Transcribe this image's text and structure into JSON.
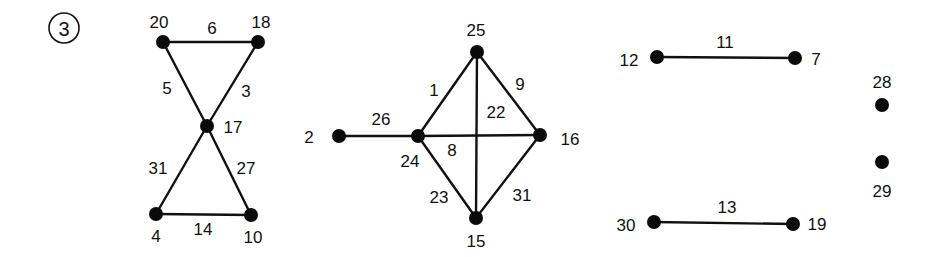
{
  "problem": {
    "number": "3",
    "x": 64,
    "y": 28,
    "r": 15
  },
  "colors": {
    "ink": "#111111",
    "background": "#ffffff"
  },
  "graph": {
    "nodes": [
      {
        "id": "20",
        "x": 163,
        "y": 42,
        "label": "20",
        "lx": 159,
        "ly": 22
      },
      {
        "id": "18",
        "x": 258,
        "y": 42,
        "label": "18",
        "lx": 261,
        "ly": 22
      },
      {
        "id": "17",
        "x": 207,
        "y": 126,
        "label": "17",
        "lx": 233,
        "ly": 127
      },
      {
        "id": "4",
        "x": 156,
        "y": 214,
        "label": "4",
        "lx": 156,
        "ly": 236
      },
      {
        "id": "10",
        "x": 251,
        "y": 215,
        "label": "10",
        "lx": 253,
        "ly": 237
      },
      {
        "id": "2",
        "x": 339,
        "y": 136,
        "label": "2",
        "lx": 309,
        "ly": 137
      },
      {
        "id": "24",
        "x": 418,
        "y": 136,
        "label": "24",
        "lx": 410,
        "ly": 161
      },
      {
        "id": "25",
        "x": 477,
        "y": 52,
        "label": "25",
        "lx": 476,
        "ly": 30
      },
      {
        "id": "16",
        "x": 540,
        "y": 135,
        "label": "16",
        "lx": 570,
        "ly": 139
      },
      {
        "id": "15",
        "x": 476,
        "y": 218,
        "label": "15",
        "lx": 476,
        "ly": 241
      },
      {
        "id": "12",
        "x": 657,
        "y": 57,
        "label": "12",
        "lx": 629,
        "ly": 60
      },
      {
        "id": "7",
        "x": 795,
        "y": 58,
        "label": "7",
        "lx": 816,
        "ly": 59
      },
      {
        "id": "28",
        "x": 882,
        "y": 105,
        "label": "28",
        "lx": 882,
        "ly": 82
      },
      {
        "id": "29",
        "x": 882,
        "y": 162,
        "label": "29",
        "lx": 882,
        "ly": 191
      },
      {
        "id": "30",
        "x": 654,
        "y": 222,
        "label": "30",
        "lx": 626,
        "ly": 225
      },
      {
        "id": "19",
        "x": 793,
        "y": 224,
        "label": "19",
        "lx": 817,
        "ly": 224
      }
    ],
    "edges": [
      {
        "from": "20",
        "to": "18",
        "weight": "6",
        "lx": 212,
        "ly": 28
      },
      {
        "from": "20",
        "to": "17",
        "weight": "5",
        "lx": 167,
        "ly": 88
      },
      {
        "from": "18",
        "to": "17",
        "weight": "3",
        "lx": 246,
        "ly": 91
      },
      {
        "from": "17",
        "to": "4",
        "weight": "31",
        "lx": 158,
        "ly": 168
      },
      {
        "from": "17",
        "to": "10",
        "weight": "27",
        "lx": 246,
        "ly": 168
      },
      {
        "from": "4",
        "to": "10",
        "weight": "14",
        "lx": 203,
        "ly": 229
      },
      {
        "from": "2",
        "to": "24",
        "weight": "26",
        "lx": 381,
        "ly": 119
      },
      {
        "from": "24",
        "to": "25",
        "weight": "1",
        "lx": 434,
        "ly": 90
      },
      {
        "from": "25",
        "to": "16",
        "weight": "9",
        "lx": 520,
        "ly": 84
      },
      {
        "from": "25",
        "to": "15",
        "weight": "22",
        "lx": 496,
        "ly": 112
      },
      {
        "from": "24",
        "to": "16",
        "weight": "8",
        "lx": 452,
        "ly": 150
      },
      {
        "from": "24",
        "to": "15",
        "weight": "23",
        "lx": 439,
        "ly": 197
      },
      {
        "from": "16",
        "to": "15",
        "weight": "31",
        "lx": 522,
        "ly": 195
      },
      {
        "from": "12",
        "to": "7",
        "weight": "11",
        "lx": 725,
        "ly": 42
      },
      {
        "from": "30",
        "to": "19",
        "weight": "13",
        "lx": 727,
        "ly": 207
      }
    ]
  }
}
